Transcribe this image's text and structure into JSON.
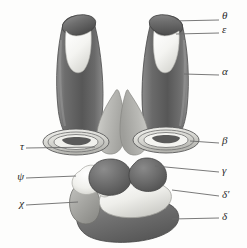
{
  "figure": {
    "background_color": "#fdfdfc",
    "line_color": "#6b6b6b",
    "text_color": "#2b2b2b"
  },
  "palette": {
    "dark_gray": "#5d5d5d",
    "mid_dark_gray": "#757575",
    "mid_gray": "#9a9a9a",
    "light_gray": "#c2c2c2",
    "pale_gray": "#d8d8d8",
    "near_white": "#f2f2ef",
    "white": "#ffffff",
    "outline": "#4a4a4a"
  },
  "labels": [
    {
      "id": "theta",
      "glyph": "θ",
      "side": "right",
      "x": 224,
      "y": 16,
      "leader_x1": 172,
      "leader_y1": 21,
      "leader_x2": 219,
      "leader_y2": 20
    },
    {
      "id": "epsilon",
      "glyph": "ε",
      "side": "right",
      "x": 224,
      "y": 30,
      "leader_x1": 176,
      "leader_y1": 34,
      "leader_x2": 219,
      "leader_y2": 33
    },
    {
      "id": "alpha",
      "glyph": "α",
      "side": "right",
      "x": 224,
      "y": 72,
      "leader_x1": 184,
      "leader_y1": 74,
      "leader_x2": 219,
      "leader_y2": 75
    },
    {
      "id": "beta",
      "glyph": "β",
      "side": "right",
      "x": 224,
      "y": 141,
      "leader_x1": 190,
      "leader_y1": 141,
      "leader_x2": 219,
      "leader_y2": 143
    },
    {
      "id": "gamma",
      "glyph": "γ",
      "side": "right",
      "x": 224,
      "y": 170,
      "leader_x1": 155,
      "leader_y1": 166,
      "leader_x2": 219,
      "leader_y2": 172
    },
    {
      "id": "delta-prime",
      "glyph": "δ′",
      "side": "right",
      "x": 224,
      "y": 194,
      "leader_x1": 172,
      "leader_y1": 190,
      "leader_x2": 219,
      "leader_y2": 196
    },
    {
      "id": "delta",
      "glyph": "δ",
      "side": "right",
      "x": 224,
      "y": 217,
      "leader_x1": 172,
      "leader_y1": 219,
      "leader_x2": 219,
      "leader_y2": 218
    },
    {
      "id": "tau",
      "glyph": "τ",
      "side": "left",
      "x": 22,
      "y": 146,
      "leader_x1": 26,
      "leader_y1": 148,
      "leader_x2": 95,
      "leader_y2": 147
    },
    {
      "id": "psi",
      "glyph": "ψ",
      "side": "left",
      "x": 22,
      "y": 176,
      "leader_x1": 26,
      "leader_y1": 178,
      "leader_x2": 76,
      "leader_y2": 176
    },
    {
      "id": "chi",
      "glyph": "χ",
      "side": "left",
      "x": 22,
      "y": 203,
      "leader_x1": 26,
      "leader_y1": 205,
      "leader_x2": 78,
      "leader_y2": 202
    }
  ],
  "structures": [
    {
      "id": "left-column",
      "label_ref": "alpha",
      "description": "left elongated dark cylinder"
    },
    {
      "id": "right-column",
      "label_ref": "alpha",
      "description": "right elongated dark cylinder"
    },
    {
      "id": "left-column-rim",
      "label_ref": "theta",
      "description": "left cylinder dark elliptical rim"
    },
    {
      "id": "right-column-rim",
      "label_ref": "theta",
      "description": "right cylinder dark elliptical rim"
    },
    {
      "id": "left-inner-face",
      "label_ref": "epsilon",
      "description": "left cylinder pale inner surface"
    },
    {
      "id": "right-inner-face",
      "label_ref": "epsilon",
      "description": "right cylinder pale inner surface"
    },
    {
      "id": "left-ring",
      "label_ref": "tau",
      "description": "left concentric elliptical ring"
    },
    {
      "id": "right-ring",
      "label_ref": "beta",
      "description": "right concentric elliptical ring"
    },
    {
      "id": "central-lobe-left",
      "label_ref": "tau",
      "description": "left central pale teardrop lobe"
    },
    {
      "id": "central-lobe-right",
      "label_ref": "tau",
      "description": "right central pale teardrop lobe"
    },
    {
      "id": "upper-dark-lobe-left",
      "label_ref": "gamma",
      "description": "left upper dark rounded lobe"
    },
    {
      "id": "upper-dark-lobe-right",
      "label_ref": "gamma",
      "description": "right upper dark rounded lobe"
    },
    {
      "id": "white-lobe-left",
      "label_ref": "psi",
      "description": "left white flange lobe"
    },
    {
      "id": "pale-band",
      "label_ref": "delta-prime",
      "description": "broad pale curved band"
    },
    {
      "id": "mid-gray-lobe",
      "label_ref": "chi",
      "description": "lower-left mid-gray lobe"
    },
    {
      "id": "basal-mass",
      "label_ref": "delta",
      "description": "large dark basal kidney-shaped mass"
    }
  ]
}
